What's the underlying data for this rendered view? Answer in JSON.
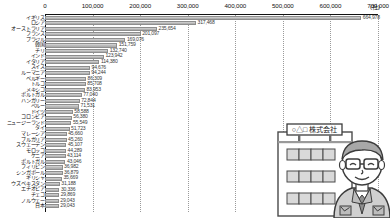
{
  "chart_data": {
    "type": "bar",
    "orientation": "horizontal",
    "title": "",
    "xlabel": "",
    "ylabel": "",
    "unit_label": "(社)",
    "xlim": [
      0,
      700000
    ],
    "grid": true,
    "legend": "none",
    "tick_labels": [
      "0",
      "100,000",
      "200,000",
      "300,000",
      "400,000",
      "500,000",
      "600,000",
      "700,000"
    ],
    "tick_values": [
      0,
      100000,
      200000,
      300000,
      400000,
      500000,
      600000,
      700000
    ],
    "categories": [
      "イギリス",
      "ロシア",
      "オーストラリア",
      "フランス",
      "ブラジル",
      "韓国",
      "チリ",
      "インド",
      "イタリア",
      "スイス",
      "ルーマニア",
      "ベルギー",
      "トルコ",
      "メキシコ",
      "ポルトガル",
      "ハンガリー",
      "ペルー",
      "ドイツ",
      "コロンビア",
      "ニュージーランド",
      "タイ",
      "マレーシア",
      "ブルガリア",
      "スウェーデン",
      "モロッコ",
      "ケニア",
      "ポルトガル",
      "フィリピン",
      "シンガポール",
      "ギリシャ",
      "ウズベキスタン",
      "エチオピア",
      "チェコ",
      "ノルウェー",
      "日本"
    ],
    "values": [
      664978,
      317468,
      235654,
      201097,
      169076,
      151759,
      132740,
      123942,
      114380,
      94676,
      94244,
      86309,
      85708,
      83953,
      77040,
      72844,
      71531,
      58588,
      56380,
      55549,
      51723,
      45660,
      45260,
      45107,
      44289,
      43114,
      43046,
      36982,
      36879,
      35669,
      31188,
      30336,
      29869,
      29043,
      29043
    ],
    "value_labels": [
      "664,978",
      "317,468",
      "235,654",
      "201,097",
      "169,076",
      "151,759",
      "132,740",
      "123,942",
      "114,380",
      "94,676",
      "94,244",
      "86,309",
      "85,708",
      "83,953",
      "77,040",
      "72,844",
      "71,531",
      "58,588",
      "56,380",
      "55,549",
      "51,723",
      "45,660",
      "45,260",
      "45,107",
      "44,289",
      "43,114",
      "43,046",
      "36,982",
      "36,879",
      "35,669",
      "31,188",
      "30,336",
      "29,869",
      "29,043",
      "29,043"
    ]
  },
  "illustration": {
    "building_sign": "○△□ 株式会社",
    "alt": "office building and businessman"
  },
  "colors": {
    "bar_fill": "#bdbdbd",
    "bar_border": "#8e8e8e",
    "axis": "#111111",
    "gridline": "#9a9a9a",
    "text": "#111111"
  }
}
